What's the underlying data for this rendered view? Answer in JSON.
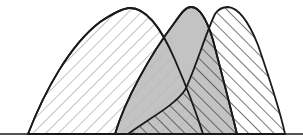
{
  "diagram": {
    "type": "overlapping-distribution-curves",
    "baseline_y": 134,
    "colors": {
      "background": "#ffffff",
      "outline": "#1a1a1a",
      "fill_middle": "#b8b8b8",
      "hatch_left": "#9a9a9a",
      "hatch_right": "#2a2a2a"
    },
    "curves": [
      {
        "name": "left-distribution",
        "style": "hatched-backslash",
        "start_x": 28,
        "peak_x": 128,
        "peak_y": 8,
        "end_x": 203
      },
      {
        "name": "middle-distribution",
        "style": "solid-gray",
        "start_x": 115,
        "peak_x": 190,
        "peak_y": 7,
        "end_x": 237
      },
      {
        "name": "right-distribution",
        "style": "hatched-forwardslash",
        "start_x": 128,
        "peak_x": 225,
        "peak_y": 8,
        "end_x": 285
      }
    ]
  }
}
